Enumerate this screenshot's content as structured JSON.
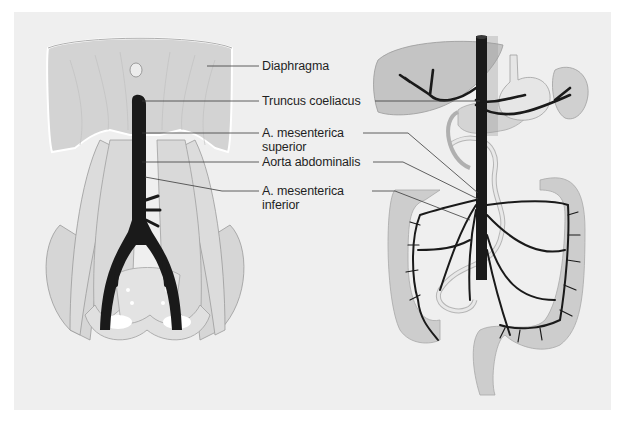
{
  "figure": {
    "type": "anatomical illustration",
    "background_color": "#efefef",
    "artery_color": "#1a1a1a",
    "organ_color": "#c8c8c8",
    "muscle_color": "#d9d9d9"
  },
  "left_illustration": {
    "name": "posterior abdominal wall with diaphragm, psoas muscles, pelvis and abdominal aorta"
  },
  "right_illustration": {
    "name": "abdominal organs (liver, stomach, spleen, pancreas, intestines) with aortic branches"
  },
  "labels": [
    {
      "id": "diaphragma",
      "lines": [
        "Diaphragma"
      ]
    },
    {
      "id": "truncus-coeliacus",
      "lines": [
        "Truncus coeliacus"
      ]
    },
    {
      "id": "a-mesenterica-superior",
      "lines": [
        "A. mesenterica",
        "superior"
      ]
    },
    {
      "id": "aorta-abdominalis",
      "lines": [
        "Aorta abdominalis"
      ]
    },
    {
      "id": "a-mesenterica-inferior",
      "lines": [
        "A. mesenterica",
        "inferior"
      ]
    }
  ]
}
